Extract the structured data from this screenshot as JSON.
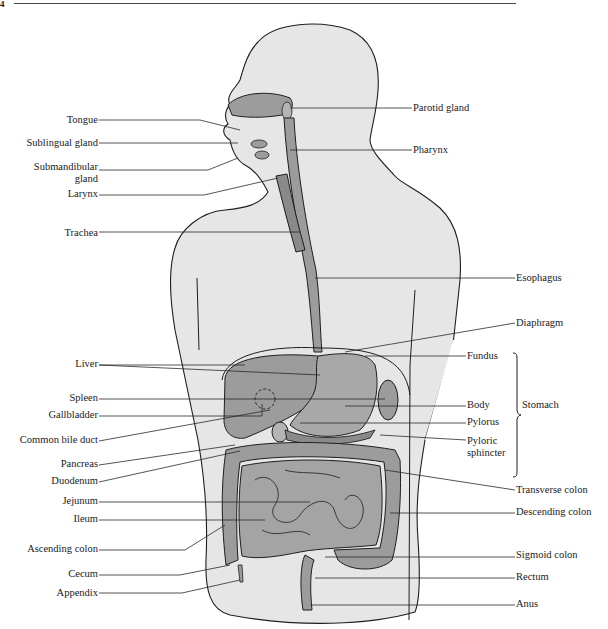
{
  "page": {
    "corner_mark": "4",
    "figure_title": "Human digestive system"
  },
  "colors": {
    "body_fill": "#e6e6e6",
    "organ_fill": "#9c9c9c",
    "organ_light": "#b4b4b4",
    "outline": "#1e1e1e",
    "leader_line": "#2a2a2a",
    "background": "#ffffff"
  },
  "labels_left": [
    {
      "id": "tongue",
      "text": "Tongue",
      "x": 98,
      "y": 120
    },
    {
      "id": "sublingual-gland",
      "text": "Sublingual gland",
      "x": 98,
      "y": 143
    },
    {
      "id": "submandibular-gland",
      "text": "Submandibular\ngland",
      "x": 98,
      "y": 167
    },
    {
      "id": "larynx",
      "text": "Larynx",
      "x": 98,
      "y": 194
    },
    {
      "id": "trachea",
      "text": "Trachea",
      "x": 98,
      "y": 233
    },
    {
      "id": "liver",
      "text": "Liver",
      "x": 98,
      "y": 364
    },
    {
      "id": "spleen",
      "text": "Spleen",
      "x": 98,
      "y": 398
    },
    {
      "id": "gallbladder",
      "text": "Gallbladder",
      "x": 98,
      "y": 415
    },
    {
      "id": "common-bile-duct",
      "text": "Common bile duct",
      "x": 98,
      "y": 440
    },
    {
      "id": "pancreas",
      "text": "Pancreas",
      "x": 98,
      "y": 464
    },
    {
      "id": "duodenum",
      "text": "Duodenum",
      "x": 98,
      "y": 481
    },
    {
      "id": "jejunum",
      "text": "Jejunum",
      "x": 98,
      "y": 501
    },
    {
      "id": "ileum",
      "text": "Ileum",
      "x": 98,
      "y": 519
    },
    {
      "id": "ascending-colon",
      "text": "Ascending colon",
      "x": 98,
      "y": 549
    },
    {
      "id": "cecum",
      "text": "Cecum",
      "x": 98,
      "y": 574
    },
    {
      "id": "appendix",
      "text": "Appendix",
      "x": 98,
      "y": 593
    }
  ],
  "labels_right": [
    {
      "id": "parotid-gland",
      "text": "Parotid gland",
      "x": 413,
      "y": 108
    },
    {
      "id": "pharynx",
      "text": "Pharynx",
      "x": 413,
      "y": 150
    },
    {
      "id": "esophagus",
      "text": "Esophagus",
      "x": 516,
      "y": 278
    },
    {
      "id": "diaphragm",
      "text": "Diaphragm",
      "x": 516,
      "y": 323
    },
    {
      "id": "fundus",
      "text": "Fundus",
      "x": 467,
      "y": 356
    },
    {
      "id": "body",
      "text": "Body",
      "x": 467,
      "y": 405
    },
    {
      "id": "pylorus",
      "text": "Pylorus",
      "x": 467,
      "y": 422
    },
    {
      "id": "pyloric-sphincter",
      "text": "Pyloric\nsphincter",
      "x": 467,
      "y": 441
    },
    {
      "id": "transverse-colon",
      "text": "Transverse colon",
      "x": 516,
      "y": 490
    },
    {
      "id": "descending-colon",
      "text": "Descending colon",
      "x": 516,
      "y": 512
    },
    {
      "id": "sigmoid-colon",
      "text": "Sigmoid colon",
      "x": 516,
      "y": 555
    },
    {
      "id": "rectum",
      "text": "Rectum",
      "x": 516,
      "y": 577
    },
    {
      "id": "anus",
      "text": "Anus",
      "x": 516,
      "y": 604
    }
  ],
  "group_label": {
    "id": "stomach",
    "text": "Stomach",
    "x": 522,
    "y": 405
  },
  "leaders": [
    {
      "from": [
        99,
        120
      ],
      "to": [
        200,
        120
      ],
      "end": [
        240,
        130
      ]
    },
    {
      "from": [
        99,
        143
      ],
      "to": [
        238,
        143
      ],
      "end": [
        238,
        143
      ]
    },
    {
      "from": [
        99,
        170
      ],
      "to": [
        208,
        170
      ],
      "end": [
        238,
        158
      ]
    },
    {
      "from": [
        99,
        195
      ],
      "to": [
        204,
        195
      ],
      "end": [
        278,
        178
      ]
    },
    {
      "from": [
        99,
        232
      ],
      "to": [
        300,
        232
      ],
      "end": [
        300,
        232
      ]
    },
    {
      "from": [
        412,
        108
      ],
      "to": [
        290,
        108
      ],
      "end": [
        290,
        108
      ]
    },
    {
      "from": [
        412,
        150
      ],
      "to": [
        290,
        150
      ],
      "end": [
        290,
        150
      ]
    },
    {
      "from": [
        515,
        278
      ],
      "to": [
        315,
        278
      ],
      "end": [
        315,
        278
      ]
    },
    {
      "from": [
        515,
        323
      ],
      "to": [
        345,
        352
      ],
      "end": [
        345,
        352
      ]
    },
    {
      "from": [
        466,
        356
      ],
      "to": [
        365,
        356
      ],
      "end": [
        365,
        356
      ]
    },
    {
      "from": [
        99,
        365
      ],
      "to": [
        245,
        365
      ],
      "end": [
        245,
        365
      ]
    },
    {
      "from": [
        99,
        365
      ],
      "to": [
        320,
        375
      ],
      "end": [
        320,
        375
      ]
    },
    {
      "from": [
        99,
        399
      ],
      "to": [
        385,
        399
      ],
      "end": [
        385,
        399
      ]
    },
    {
      "from": [
        99,
        416
      ],
      "to": [
        262,
        416
      ],
      "end": [
        262,
        404
      ]
    },
    {
      "from": [
        99,
        441
      ],
      "to": [
        270,
        410
      ],
      "end": [
        270,
        410
      ]
    },
    {
      "from": [
        99,
        465
      ],
      "to": [
        235,
        445
      ],
      "end": [
        235,
        445
      ]
    },
    {
      "from": [
        99,
        482
      ],
      "to": [
        240,
        451
      ],
      "end": [
        240,
        451
      ]
    },
    {
      "from": [
        466,
        406
      ],
      "to": [
        345,
        406
      ],
      "end": [
        345,
        406
      ]
    },
    {
      "from": [
        466,
        423
      ],
      "to": [
        300,
        423
      ],
      "end": [
        300,
        423
      ]
    },
    {
      "from": [
        466,
        440
      ],
      "to": [
        380,
        435
      ],
      "end": [
        380,
        435
      ]
    },
    {
      "from": [
        99,
        502
      ],
      "to": [
        310,
        502
      ],
      "end": [
        310,
        502
      ]
    },
    {
      "from": [
        99,
        520
      ],
      "to": [
        265,
        520
      ],
      "end": [
        265,
        520
      ]
    },
    {
      "from": [
        99,
        550
      ],
      "to": [
        185,
        550
      ],
      "end": [
        225,
        525
      ]
    },
    {
      "from": [
        99,
        575
      ],
      "to": [
        180,
        575
      ],
      "end": [
        230,
        565
      ]
    },
    {
      "from": [
        99,
        593
      ],
      "to": [
        182,
        593
      ],
      "end": [
        240,
        580
      ]
    },
    {
      "from": [
        515,
        490
      ],
      "to": [
        385,
        470
      ],
      "end": [
        385,
        470
      ]
    },
    {
      "from": [
        515,
        513
      ],
      "to": [
        390,
        513
      ],
      "end": [
        390,
        513
      ]
    },
    {
      "from": [
        515,
        557
      ],
      "to": [
        325,
        557
      ],
      "end": [
        325,
        557
      ]
    },
    {
      "from": [
        515,
        578
      ],
      "to": [
        315,
        578
      ],
      "end": [
        315,
        578
      ]
    },
    {
      "from": [
        515,
        605
      ],
      "to": [
        312,
        605
      ],
      "end": [
        312,
        605
      ]
    }
  ]
}
